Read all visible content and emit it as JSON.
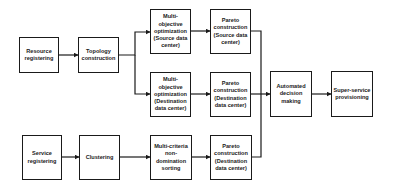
{
  "nodes": {
    "resource_registering": "Resource registering",
    "topology_construction": "Topology construction",
    "moo_source": "Multi-objective optimization (Source data center)",
    "moo_destination": "Multi-objective optimization (Destination data center)",
    "pareto_source": "Pareto construction (Source data center)",
    "pareto_destination_mid": "Pareto construction (Destination data center)",
    "automated_decision": "Automated decision making",
    "super_service": "Super-service provisioning",
    "service_registering": "Service registering",
    "clustering": "Clustering",
    "multi_criteria": "Multi-criteria non-domination sorting",
    "pareto_destination_bottom": "Pareto construction (Destination data center)"
  },
  "edges": [
    [
      "resource_registering",
      "topology_construction"
    ],
    [
      "topology_construction",
      "moo_source"
    ],
    [
      "topology_construction",
      "moo_destination"
    ],
    [
      "moo_source",
      "pareto_source"
    ],
    [
      "moo_destination",
      "pareto_destination_mid"
    ],
    [
      "pareto_source",
      "automated_decision"
    ],
    [
      "pareto_destination_mid",
      "automated_decision"
    ],
    [
      "pareto_destination_bottom",
      "automated_decision"
    ],
    [
      "automated_decision",
      "super_service"
    ],
    [
      "service_registering",
      "clustering"
    ],
    [
      "clustering",
      "multi_criteria"
    ],
    [
      "multi_criteria",
      "pareto_destination_bottom"
    ]
  ]
}
